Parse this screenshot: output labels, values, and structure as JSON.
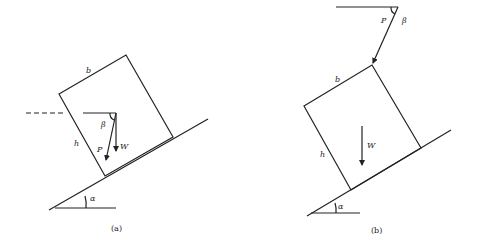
{
  "figure": {
    "panel_a": {
      "caption": "(a)",
      "labels": {
        "width": "b",
        "height": "h",
        "force": "P",
        "weight": "W",
        "force_angle": "β",
        "incline_angle": "α"
      }
    },
    "panel_b": {
      "caption": "(b)",
      "labels": {
        "width": "b",
        "height": "h",
        "force": "P",
        "weight": "W",
        "force_angle": "β",
        "incline_angle": "α"
      }
    },
    "colors": {
      "ink": "#222222",
      "background": "#ffffff"
    }
  }
}
